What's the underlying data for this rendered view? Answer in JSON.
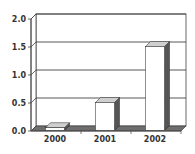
{
  "chart_data": {
    "type": "bar",
    "style": "3d-column",
    "title": "",
    "xlabel": "",
    "ylabel": "",
    "categories": [
      "2000",
      "2001",
      "2002"
    ],
    "values": [
      0.05,
      0.5,
      1.5
    ],
    "ylim": [
      0,
      2.0
    ],
    "yticks": [
      "0.0",
      "0.5",
      "1.0",
      "1.5",
      "2.0"
    ],
    "grid": true,
    "legend": null,
    "colors": {
      "bar_face": "#ffffff",
      "bar_top": "#cfcfcf",
      "bar_side": "#555555",
      "floor": "#6e6e6e",
      "grid": "#444444",
      "axis": "#444444"
    }
  }
}
